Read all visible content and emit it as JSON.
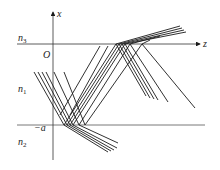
{
  "diagram": {
    "axes": {
      "vertical_label": "x",
      "horizontal_label": "z",
      "origin_label": "O",
      "lower_boundary_label": "−a"
    },
    "regions": [
      {
        "name": "n3",
        "base": "n",
        "index": "3"
      },
      {
        "name": "n1",
        "base": "n",
        "index": "1"
      },
      {
        "name": "n2",
        "base": "n",
        "index": "2"
      }
    ],
    "colors": {
      "line": "#1a1a1a",
      "boundary": "#555555"
    },
    "incident_rays_x": [
      34,
      38,
      42,
      46,
      54,
      64
    ]
  }
}
